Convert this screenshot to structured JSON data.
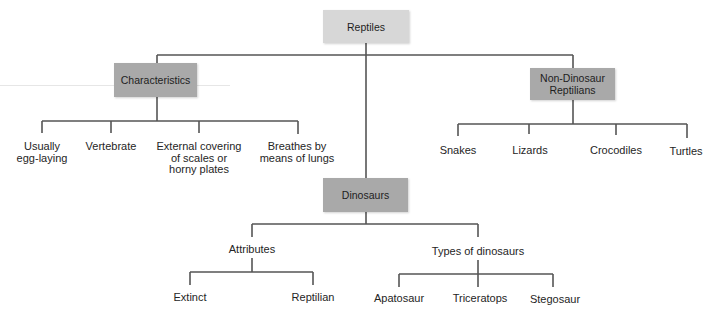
{
  "diagram": {
    "root": {
      "label": "Reptiles"
    },
    "characteristics": {
      "label": "Characteristics",
      "children": [
        {
          "lines": [
            "Usually",
            "egg-laying"
          ]
        },
        {
          "lines": [
            "Vertebrate"
          ]
        },
        {
          "lines": [
            "External covering",
            "of scales or",
            "horny plates"
          ]
        },
        {
          "lines": [
            "Breathes by",
            "means of lungs"
          ]
        }
      ]
    },
    "non_dinosaur": {
      "lines": [
        "Non-Dinosaur",
        "Reptilians"
      ],
      "children": [
        "Snakes",
        "Lizards",
        "Crocodiles",
        "Turtles"
      ]
    },
    "dinosaurs": {
      "label": "Dinosaurs",
      "attributes": {
        "label": "Attributes",
        "children": [
          "Extinct",
          "Reptilian"
        ]
      },
      "types": {
        "label": "Types of dinosaurs",
        "children": [
          "Apatosaur",
          "Triceratops",
          "Stegosaur"
        ]
      }
    },
    "colors": {
      "root_box": "#d7d7d7",
      "category_box": "#a9a9a9",
      "lines": "#555555"
    }
  }
}
